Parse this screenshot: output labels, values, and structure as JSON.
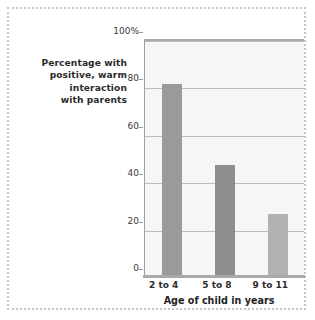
{
  "chart_data": {
    "type": "bar",
    "title": "",
    "subtitle": "",
    "xlabel": "Age of child in years",
    "ylabel": "Percentage with positive, warm interaction with parents",
    "ylabel_lines": [
      "Percentage with",
      "positive, warm",
      "interaction",
      "with parents"
    ],
    "categories": [
      "2 to 4",
      "5 to 8",
      "9 to 11"
    ],
    "values": [
      81,
      47,
      26
    ],
    "ylim": [
      0,
      100
    ],
    "ytick_values": [
      0,
      20,
      40,
      60,
      80,
      100
    ],
    "ytick_labels": [
      "0",
      "20",
      "40",
      "60",
      "80",
      "100%"
    ],
    "grid": true,
    "legend": "none",
    "bar_colors": [
      "#9a9a9a",
      "#8e8e8e",
      "#b2b2b2"
    ],
    "plot_background": "#f6f6f6",
    "gridline_color": "#bdbdbd",
    "axis_color": "#a9a9a9",
    "frame_color": "#c6c6c6"
  }
}
